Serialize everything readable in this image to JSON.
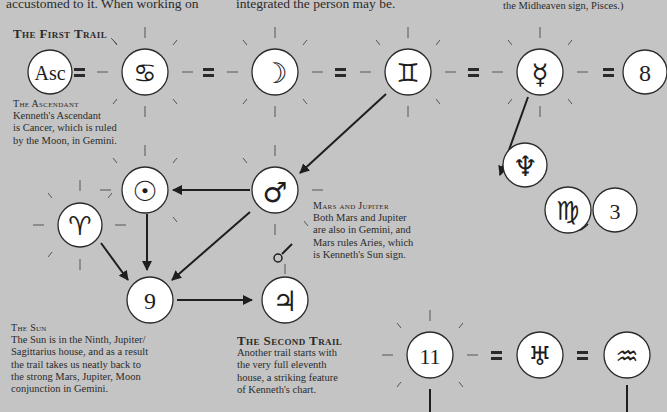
{
  "colors": {
    "background": "#c4c4c4",
    "node_fill": "#ffffff",
    "ink": "#1e1e1e",
    "ray": "#5a5a5a"
  },
  "top_text": {
    "left_fragment": "accustomed to it. When working on",
    "middle_fragment": "integrated the person may be.",
    "right_fragment": "the Midheaven sign, Pisces.)"
  },
  "first_trail": {
    "title": "The First Trail",
    "nodes": [
      {
        "id": "ascendant",
        "label": "Asc",
        "icon": "ascendant-text"
      },
      {
        "id": "cancer",
        "label": "♋",
        "icon": "cancer-icon"
      },
      {
        "id": "moon",
        "label": "☽",
        "icon": "moon-icon"
      },
      {
        "id": "gemini",
        "label": "♊",
        "icon": "gemini-icon"
      },
      {
        "id": "mercury",
        "label": "☿",
        "icon": "mercury-icon"
      },
      {
        "id": "house8",
        "label": "8",
        "icon": "house-number"
      }
    ],
    "separator": "="
  },
  "captions": {
    "ascendant": {
      "title": "The Ascendant",
      "lines": [
        "Kenneth's Ascendant",
        "is Cancer, which is ruled",
        "by the Moon, in Gemini."
      ]
    },
    "mars_jupiter": {
      "title": "Mars and Jupiter",
      "lines": [
        "Both Mars and Jupiter",
        "are also in Gemini, and",
        "Mars rules Aries, which",
        "is Kenneth's Sun sign."
      ]
    },
    "sun": {
      "title": "The Sun",
      "lines": [
        "The Sun is in the Ninth, Jupiter/",
        "Sagittarius house, and as a result",
        "the trail takes us neatly back to",
        "the strong Mars, Jupiter, Moon",
        "conjunction in Gemini."
      ]
    },
    "second_trail": {
      "title": "The Second Trail",
      "lines": [
        "Another trail starts with",
        "the very full eleventh",
        "house, a striking feature",
        "of Kenneth's chart."
      ]
    }
  },
  "middle_nodes": {
    "sun": {
      "label": "☉",
      "icon": "sun-icon"
    },
    "mars": {
      "label": "♂",
      "icon": "mars-icon"
    },
    "aries": {
      "label": "♈",
      "icon": "aries-icon"
    },
    "house9": {
      "label": "9",
      "icon": "house-number"
    },
    "jupiter": {
      "label": "♃",
      "icon": "jupiter-icon"
    },
    "neptune": {
      "label": "♆",
      "icon": "neptune-icon"
    },
    "virgo": {
      "label": "♍",
      "icon": "virgo-icon"
    },
    "house3": {
      "label": "3",
      "icon": "house-number"
    }
  },
  "second_trail": {
    "nodes": [
      {
        "id": "house11",
        "label": "11",
        "icon": "house-number"
      },
      {
        "id": "uranus",
        "label": "♅",
        "icon": "uranus-icon"
      },
      {
        "id": "aquarius",
        "label": "♒",
        "icon": "aquarius-icon"
      }
    ],
    "separator": "="
  }
}
